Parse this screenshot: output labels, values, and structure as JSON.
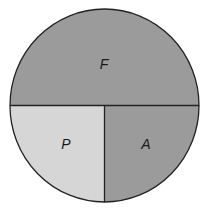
{
  "diagram": {
    "type": "circle-partition",
    "regions": [
      {
        "id": "F",
        "label": "F",
        "color": "#9b9b9b",
        "portion": "top half"
      },
      {
        "id": "P",
        "label": "P",
        "color": "#d6d6d6",
        "portion": "bottom-left quarter"
      },
      {
        "id": "A",
        "label": "A",
        "color": "#9b9b9b",
        "portion": "bottom-right quarter"
      }
    ],
    "stroke_color": "#222222"
  }
}
